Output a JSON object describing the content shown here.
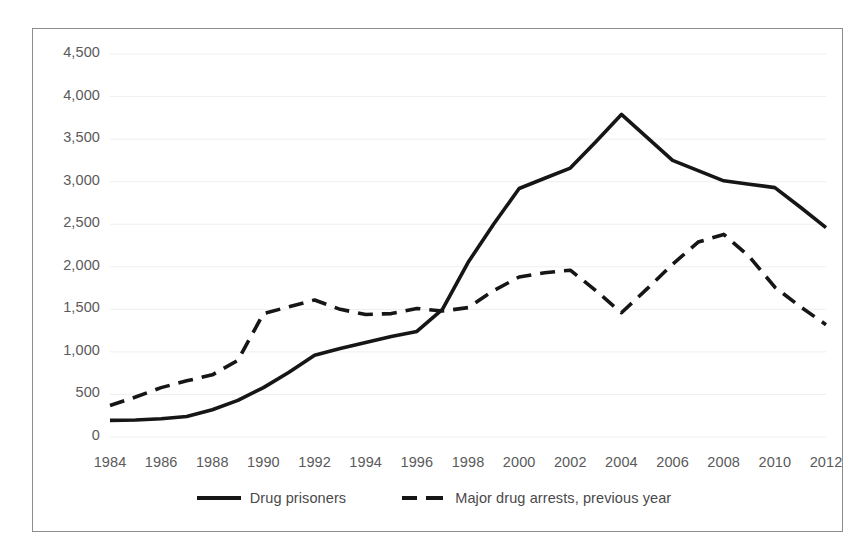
{
  "chart_data": {
    "type": "line",
    "title": "",
    "subtitle": "",
    "xlabel": "",
    "ylabel": "",
    "xlim": [
      1984,
      2012
    ],
    "ylim": [
      0,
      4500
    ],
    "grid": true,
    "legend_position": "bottom",
    "x": [
      1984,
      1985,
      1986,
      1987,
      1988,
      1989,
      1990,
      1991,
      1992,
      1993,
      1994,
      1995,
      1996,
      1997,
      1998,
      1999,
      2000,
      2001,
      2002,
      2003,
      2004,
      2005,
      2006,
      2007,
      2008,
      2009,
      2010,
      2011,
      2012
    ],
    "x_tick_labels": [
      "1984",
      "1986",
      "1988",
      "1990",
      "1992",
      "1994",
      "1996",
      "1998",
      "2000",
      "2002",
      "2004",
      "2006",
      "2008",
      "2010",
      "2012"
    ],
    "x_tick_values": [
      1984,
      1986,
      1988,
      1990,
      1992,
      1994,
      1996,
      1998,
      2000,
      2002,
      2004,
      2006,
      2008,
      2010,
      2012
    ],
    "y_tick_labels": [
      "0",
      "500",
      "1,000",
      "1,500",
      "2,000",
      "2,500",
      "3,000",
      "3,500",
      "4,000",
      "4,500"
    ],
    "y_tick_values": [
      0,
      500,
      1000,
      1500,
      2000,
      2500,
      3000,
      3500,
      4000,
      4500
    ],
    "series": [
      {
        "name": "Drug prisoners",
        "style": "solid",
        "color": "#161616",
        "values": [
          195,
          200,
          215,
          240,
          320,
          430,
          580,
          760,
          960,
          1040,
          1110,
          1180,
          1240,
          1500,
          2050,
          2500,
          2920,
          3040,
          3160,
          3470,
          3790,
          3520,
          3250,
          3130,
          3010,
          2970,
          2930,
          2700,
          2460
        ]
      },
      {
        "name": "Major drug arrests, previous year",
        "style": "dashed",
        "color": "#161616",
        "values": [
          370,
          470,
          580,
          660,
          730,
          900,
          1450,
          1530,
          1610,
          1500,
          1440,
          1450,
          1510,
          1480,
          1520,
          1720,
          1880,
          1930,
          1960,
          1720,
          1460,
          1740,
          2030,
          2290,
          2380,
          2120,
          1760,
          1530,
          1320
        ]
      }
    ]
  },
  "legend": {
    "entries": [
      {
        "label": "Drug prisoners",
        "style": "solid"
      },
      {
        "label": "Major drug arrests, previous year",
        "style": "dashed"
      }
    ]
  },
  "colors": {
    "line": "#161616",
    "gridline": "#efefef",
    "axis_text": "#5a5a5a",
    "frame_border": "#8c8c8c",
    "background": "#ffffff"
  }
}
